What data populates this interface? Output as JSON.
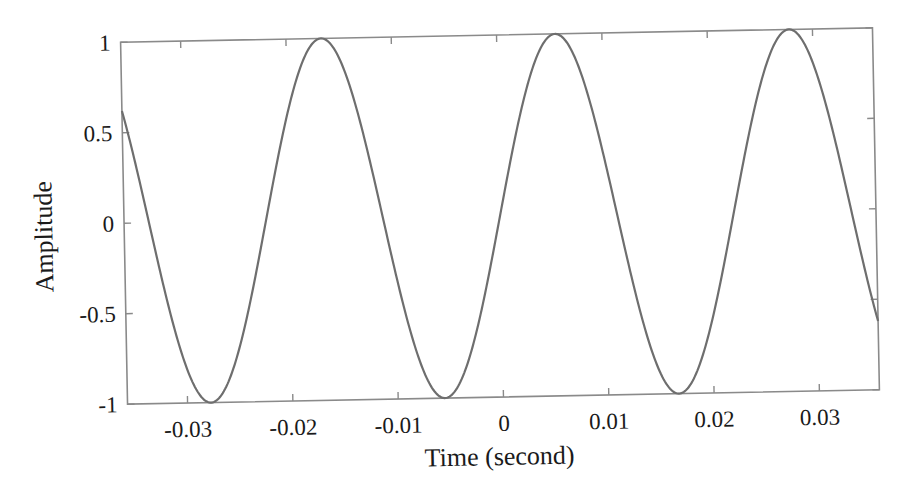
{
  "chart_data": {
    "type": "line",
    "title": "",
    "xlabel": "Time (second)",
    "ylabel": "Amplitude",
    "xlim": [
      -0.0357,
      0.0357
    ],
    "ylim": [
      -1,
      1
    ],
    "xticks": [
      -0.03,
      -0.02,
      -0.01,
      0,
      0.01,
      0.02,
      0.03
    ],
    "xtick_labels": [
      "-0.03",
      "-0.02",
      "-0.01",
      "0",
      "0.01",
      "0.02",
      "0.03"
    ],
    "yticks": [
      -1,
      -0.5,
      0,
      0.5,
      1
    ],
    "ytick_labels": [
      "-1",
      "-0.5",
      "0",
      "0.5",
      "1"
    ],
    "grid": false,
    "legend": null,
    "series": [
      {
        "name": "sinusoid",
        "description": "y = sin(2*pi*45*t)",
        "frequency_hz": 45,
        "amplitude": 1,
        "phase_rad": 0,
        "peaks_t": [
          -0.0167,
          0.0056,
          0.0278
        ],
        "troughs_t": [
          -0.0278,
          -0.0056,
          0.0167
        ],
        "x": [
          -0.0357,
          -0.03,
          -0.0278,
          -0.025,
          -0.0222,
          -0.02,
          -0.0167,
          -0.015,
          -0.0111,
          -0.01,
          -0.0056,
          -0.005,
          0,
          0.005,
          0.0056,
          0.01,
          0.0111,
          0.015,
          0.0167,
          0.02,
          0.0222,
          0.025,
          0.0278,
          0.03,
          0.0357
        ],
        "y": [
          0.62,
          -0.95,
          -1.0,
          -0.71,
          0.0,
          0.59,
          1.0,
          0.71,
          0.0,
          -0.31,
          -1.0,
          -0.99,
          0.0,
          0.99,
          1.0,
          0.31,
          0.0,
          -0.71,
          -1.0,
          -0.59,
          0.0,
          0.71,
          1.0,
          0.95,
          -0.62
        ]
      }
    ],
    "colors": {
      "line": "#6e6e6e",
      "axes": "#8a8a8a",
      "text": "#1a1a1a"
    }
  }
}
